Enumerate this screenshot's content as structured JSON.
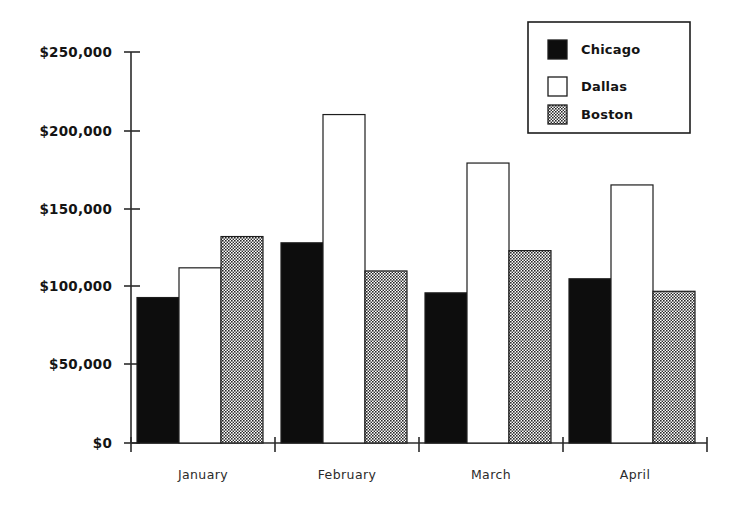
{
  "chart_data": {
    "type": "bar",
    "title": "",
    "subtitle": "",
    "xlabel": "",
    "ylabel": "",
    "categories": [
      "January",
      "February",
      "March",
      "April"
    ],
    "series": [
      {
        "name": "Chicago",
        "color": "#0d0d0d",
        "values": [
          93000,
          128000,
          96000,
          105000
        ]
      },
      {
        "name": "Dallas",
        "color": "#ffffff",
        "values": [
          112000,
          210000,
          179000,
          165000
        ]
      },
      {
        "name": "Boston",
        "color": "#707070",
        "values": [
          132000,
          110000,
          123000,
          97000
        ]
      }
    ],
    "ylim": [
      0,
      250000
    ],
    "yticks": [
      0,
      50000,
      100000,
      150000,
      200000,
      250000
    ],
    "ytick_labels": [
      "$0",
      "$50,000",
      "$100,000",
      "$150,000",
      "$200,000",
      "$250,000"
    ],
    "grid": false,
    "legend_position": "top-right",
    "legend_entries": [
      "Chicago",
      "Dallas",
      "Boston"
    ]
  },
  "legend": {
    "items": [
      {
        "label": "Chicago",
        "swatch": "legend-swatch-chicago"
      },
      {
        "label": "Dallas",
        "swatch": "legend-swatch-dallas"
      },
      {
        "label": "Boston",
        "swatch": "legend-swatch-boston"
      }
    ]
  },
  "axis": {
    "y_labels": [
      "$250,000",
      "$200,000",
      "$150,000",
      "$100,000",
      "$50,000",
      "$0"
    ],
    "x_labels": [
      "January",
      "February",
      "March",
      "April"
    ]
  }
}
